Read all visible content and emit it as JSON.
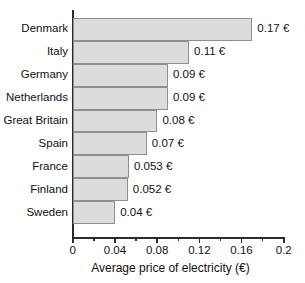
{
  "chart_data": {
    "type": "bar",
    "orientation": "horizontal",
    "title": "",
    "xlabel": "Average price of electricity (€)",
    "ylabel": "",
    "xlim": [
      0,
      0.2
    ],
    "grid": false,
    "legend": null,
    "categories": [
      "Denmark",
      "Italy",
      "Germany",
      "Netherlands",
      "Great Britain",
      "Spain",
      "France",
      "Finland",
      "Sweden"
    ],
    "values": [
      0.17,
      0.11,
      0.09,
      0.09,
      0.08,
      0.07,
      0.053,
      0.052,
      0.04
    ],
    "data_labels": [
      "0.17 €",
      "0.11 €",
      "0.09 €",
      "0.09 €",
      "0.08 €",
      "0.07 €",
      "0.053 €",
      "0.052 €",
      "0.04 €"
    ],
    "x_major_ticks": [
      0,
      0.04,
      0.08,
      0.12,
      0.16,
      0.2
    ],
    "x_major_tick_labels": [
      "0",
      "0.04",
      "0.08",
      "0.12",
      "0.16",
      "0.2"
    ],
    "x_minor_ticks": [
      0.02,
      0.06,
      0.1,
      0.14,
      0.18
    ],
    "colors": {
      "bar_fill": "#dcdcdc",
      "bar_border": "#8f8f8f",
      "axis": "#2b2b2b",
      "text": "#111111",
      "background": "#ffffff"
    }
  }
}
